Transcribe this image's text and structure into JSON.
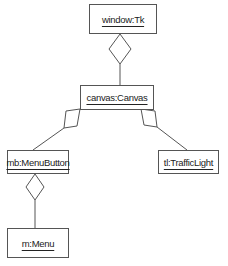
{
  "diagram": {
    "type": "uml-object-diagram",
    "objects": [
      {
        "id": "window",
        "label": "window:Tk"
      },
      {
        "id": "canvas",
        "label": "canvas:Canvas"
      },
      {
        "id": "mb",
        "label": "mb:MenuButton"
      },
      {
        "id": "tl",
        "label": "tl:TrafficLight"
      },
      {
        "id": "m",
        "label": "m:Menu"
      }
    ],
    "links": [
      {
        "whole": "window",
        "part": "canvas",
        "kind": "aggregation"
      },
      {
        "whole": "canvas",
        "part": "mb",
        "kind": "aggregation"
      },
      {
        "whole": "canvas",
        "part": "tl",
        "kind": "aggregation"
      },
      {
        "whole": "mb",
        "part": "m",
        "kind": "aggregation"
      }
    ],
    "colors": {
      "line": "#555555",
      "text": "#222222",
      "background": "#ffffff"
    }
  }
}
